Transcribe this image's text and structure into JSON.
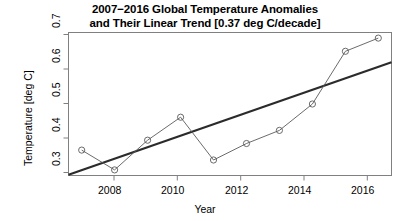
{
  "chart_data": {
    "type": "line",
    "title": "2007−2016 Global Temperature Anomalies and Their Linear Trend [0.37 deg C/decade]",
    "title_lines": [
      "2007−2016 Global Temperature Anomalies",
      "and Their Linear Trend [0.37 deg C/decade]"
    ],
    "xlabel": "Year",
    "ylabel": "Temperature [deg C]",
    "x": [
      2007,
      2008,
      2009,
      2010,
      2011,
      2012,
      2013,
      2014,
      2015,
      2016
    ],
    "xlim": [
      2006.6,
      2016.4
    ],
    "ylim": [
      0.283,
      0.717
    ],
    "xticks": [
      2008,
      2010,
      2012,
      2014,
      2016
    ],
    "xtick_labels": [
      "2008",
      "2010",
      "2012",
      "2014",
      "2016"
    ],
    "yticks": [
      0.3,
      0.4,
      0.5,
      0.6,
      0.7
    ],
    "ytick_labels": [
      "0.3",
      "0.4",
      "0.5",
      "0.6",
      "0.7"
    ],
    "grid": false,
    "legend": "none",
    "series": [
      {
        "name": "Global Temperature Anomaly",
        "type": "line",
        "marker": "open-circle",
        "color": "#555555",
        "values": [
          0.36,
          0.3,
          0.39,
          0.46,
          0.33,
          0.38,
          0.42,
          0.5,
          0.66,
          0.7
        ]
      },
      {
        "name": "Linear Trend",
        "type": "line",
        "marker": "none",
        "color": "#222222",
        "slope_per_decade": 0.37,
        "endpoints_x": [
          2006.6,
          2016.4
        ],
        "endpoints_y": [
          0.285,
          0.627
        ]
      }
    ]
  },
  "axes": {
    "y_tick_0": "0.3",
    "y_tick_1": "0.4",
    "y_tick_2": "0.5",
    "y_tick_3": "0.6",
    "y_tick_4": "0.7",
    "x_tick_0": "2008",
    "x_tick_1": "2010",
    "x_tick_2": "2012",
    "x_tick_3": "2014",
    "x_tick_4": "2016"
  }
}
